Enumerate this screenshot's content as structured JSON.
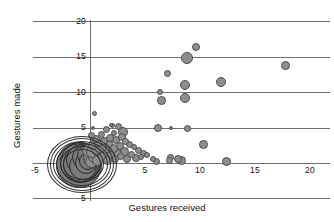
{
  "chart_data": {
    "type": "scatter",
    "title": "",
    "xlabel": "Gestures received",
    "ylabel": "Gestures made",
    "xlim": [
      -5,
      20
    ],
    "ylim": [
      -5,
      20
    ],
    "grid": true,
    "legend": null,
    "note": "Bubble scatter; marker area scales with number of overlapping observations. A very dense overplotted cluster sits near the origin (0,0).",
    "x_ticks": [
      {
        "value": -5,
        "label": "-5"
      },
      {
        "value": 5,
        "label": "5"
      },
      {
        "value": 10,
        "label": "10"
      },
      {
        "value": 15,
        "label": "15"
      },
      {
        "value": 20,
        "label": "20"
      }
    ],
    "y_ticks": [
      {
        "value": 20,
        "label": "20"
      },
      {
        "value": 15,
        "label": "15"
      },
      {
        "value": 10,
        "label": "10"
      },
      {
        "value": 5,
        "label": "5"
      },
      {
        "value": -5,
        "label": "5"
      }
    ],
    "gridlines_y": [
      20,
      15,
      10,
      5,
      0,
      -5
    ],
    "marker_fill": "#8e8e8e",
    "marker_stroke": "#4d4d4d",
    "axis_color": "#6e6e6e",
    "points": [
      {
        "x": 17.8,
        "y": 13.8,
        "size": 9
      },
      {
        "x": 11.9,
        "y": 11.4,
        "size": 10
      },
      {
        "x": 10.3,
        "y": 2.6,
        "size": 9
      },
      {
        "x": 12.4,
        "y": 0.2,
        "size": 9
      },
      {
        "x": 9.6,
        "y": 16.4,
        "size": 8
      },
      {
        "x": 8.8,
        "y": 14.9,
        "size": 12
      },
      {
        "x": 8.6,
        "y": 11.0,
        "size": 10
      },
      {
        "x": 8.6,
        "y": 9.2,
        "size": 10
      },
      {
        "x": 8.3,
        "y": 0.4,
        "size": 9
      },
      {
        "x": 8.0,
        "y": 0.6,
        "size": 8
      },
      {
        "x": 7.3,
        "y": 0.8,
        "size": 7
      },
      {
        "x": 7.2,
        "y": 0.3,
        "size": 7
      },
      {
        "x": 7.0,
        "y": 12.7,
        "size": 7
      },
      {
        "x": 6.4,
        "y": 10.0,
        "size": 6
      },
      {
        "x": 6.5,
        "y": 8.8,
        "size": 9
      },
      {
        "x": 8.9,
        "y": 4.9,
        "size": 7
      },
      {
        "x": 7.4,
        "y": 4.9,
        "size": 4
      },
      {
        "x": 6.2,
        "y": 4.9,
        "size": 8
      },
      {
        "x": 6.0,
        "y": 0.2,
        "size": 7
      },
      {
        "x": 5.7,
        "y": 0.5,
        "size": 6
      },
      {
        "x": 5.2,
        "y": 1.1,
        "size": 6
      },
      {
        "x": 4.9,
        "y": 1.4,
        "size": 7
      },
      {
        "x": 4.6,
        "y": 0.9,
        "size": 6
      },
      {
        "x": 4.4,
        "y": 1.8,
        "size": 7
      },
      {
        "x": 4.2,
        "y": 0.7,
        "size": 8
      },
      {
        "x": 4.0,
        "y": 2.2,
        "size": 6
      },
      {
        "x": 3.8,
        "y": 1.2,
        "size": 7
      },
      {
        "x": 3.6,
        "y": 2.6,
        "size": 7
      },
      {
        "x": 3.4,
        "y": 0.6,
        "size": 8
      },
      {
        "x": 3.2,
        "y": 3.0,
        "size": 7
      },
      {
        "x": 3.1,
        "y": 1.6,
        "size": 9
      },
      {
        "x": 3.0,
        "y": 4.4,
        "size": 10
      },
      {
        "x": 2.9,
        "y": 3.7,
        "size": 8
      },
      {
        "x": 2.8,
        "y": 0.9,
        "size": 7
      },
      {
        "x": 2.7,
        "y": 2.4,
        "size": 8
      },
      {
        "x": 2.6,
        "y": 5.1,
        "size": 7
      },
      {
        "x": 2.5,
        "y": 1.4,
        "size": 9
      },
      {
        "x": 2.4,
        "y": 3.2,
        "size": 8
      },
      {
        "x": 2.3,
        "y": 0.5,
        "size": 8
      },
      {
        "x": 2.2,
        "y": 4.2,
        "size": 6
      },
      {
        "x": 2.1,
        "y": 2.0,
        "size": 9
      },
      {
        "x": 2.0,
        "y": 5.3,
        "size": 5
      },
      {
        "x": 1.9,
        "y": 1.1,
        "size": 9
      },
      {
        "x": 1.8,
        "y": 3.5,
        "size": 8
      },
      {
        "x": 1.7,
        "y": 2.7,
        "size": 9
      },
      {
        "x": 1.6,
        "y": 0.3,
        "size": 9
      },
      {
        "x": 1.5,
        "y": 4.7,
        "size": 7
      },
      {
        "x": 1.4,
        "y": 1.8,
        "size": 10
      },
      {
        "x": 1.3,
        "y": 3.1,
        "size": 8
      },
      {
        "x": 1.2,
        "y": 0.8,
        "size": 10
      },
      {
        "x": 1.1,
        "y": 2.3,
        "size": 10
      },
      {
        "x": 1.0,
        "y": 4.0,
        "size": 7
      },
      {
        "x": 0.9,
        "y": 1.3,
        "size": 11
      },
      {
        "x": 0.8,
        "y": 2.9,
        "size": 9
      },
      {
        "x": 0.7,
        "y": 0.4,
        "size": 11
      },
      {
        "x": 0.6,
        "y": 1.9,
        "size": 11
      },
      {
        "x": 0.5,
        "y": 3.4,
        "size": 8
      },
      {
        "x": 0.4,
        "y": 0.9,
        "size": 12
      },
      {
        "x": 0.3,
        "y": 2.5,
        "size": 10
      },
      {
        "x": 0.2,
        "y": 1.5,
        "size": 12
      },
      {
        "x": 0.1,
        "y": 0.2,
        "size": 13
      },
      {
        "x": 0.0,
        "y": 1.0,
        "size": 14
      },
      {
        "x": 0.15,
        "y": 3.9,
        "size": 7
      },
      {
        "x": 0.05,
        "y": 0.6,
        "size": 16
      },
      {
        "x": -0.1,
        "y": 1.7,
        "size": 13
      },
      {
        "x": -0.2,
        "y": 0.3,
        "size": 18
      },
      {
        "x": -0.3,
        "y": 1.2,
        "size": 20
      },
      {
        "x": -0.4,
        "y": 0.0,
        "size": 22
      },
      {
        "x": -0.5,
        "y": 0.8,
        "size": 25
      },
      {
        "x": -0.6,
        "y": -0.4,
        "size": 28
      },
      {
        "x": -0.7,
        "y": 0.4,
        "size": 32
      },
      {
        "x": -0.8,
        "y": -0.2,
        "size": 36
      },
      {
        "x": -0.9,
        "y": 0.1,
        "size": 41
      },
      {
        "x": -1.0,
        "y": -0.3,
        "size": 46
      },
      {
        "x": 0.45,
        "y": 7.0,
        "size": 5
      },
      {
        "x": 0.25,
        "y": 5.0,
        "size": 4
      },
      {
        "x": 1.95,
        "y": 5.4,
        "size": 4
      }
    ]
  },
  "axes": {
    "x_title": "Gestures received",
    "y_title": "Gestures made"
  }
}
